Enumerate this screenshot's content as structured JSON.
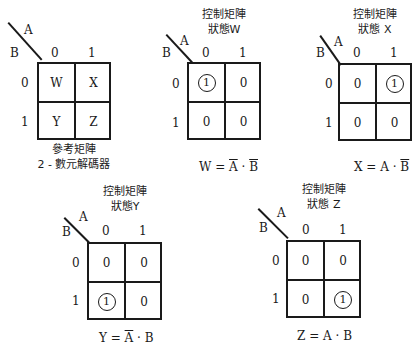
{
  "figure": {
    "axis_labels": {
      "col_var": "A",
      "row_var": "B"
    },
    "col_headers": [
      "0",
      "1"
    ],
    "row_headers": [
      "0",
      "1"
    ],
    "maps": [
      {
        "id": "reference",
        "title_line1": "",
        "title_line2": "",
        "caption_line1": "參考矩陣",
        "caption_line2": "2 - 數元解碼器",
        "cells": [
          [
            "W",
            "X"
          ],
          [
            "Y",
            "Z"
          ]
        ],
        "circled": null,
        "equation": {
          "lhs": "",
          "eq": "",
          "t1": "",
          "dot": "",
          "t2": ""
        }
      },
      {
        "id": "W",
        "title_line1": "控制矩陣",
        "title_line2": "狀態W",
        "cells": [
          [
            "1",
            "0"
          ],
          [
            "0",
            "0"
          ]
        ],
        "circled": [
          0,
          0
        ],
        "equation": {
          "lhs": "W",
          "eq": " = ",
          "t1": "A",
          "t1_bar": true,
          "dot": " · ",
          "t2": "B",
          "t2_bar": true
        }
      },
      {
        "id": "X",
        "title_line1": "控制矩陣",
        "title_line2": "狀態 X",
        "cells": [
          [
            "0",
            "1"
          ],
          [
            "0",
            "0"
          ]
        ],
        "circled": [
          0,
          1
        ],
        "equation": {
          "lhs": "X",
          "eq": " = ",
          "t1": "A",
          "t1_bar": false,
          "dot": " · ",
          "t2": "B",
          "t2_bar": true
        }
      },
      {
        "id": "Y",
        "title_line1": "控制矩陣",
        "title_line2": "狀態Y",
        "cells": [
          [
            "0",
            "0"
          ],
          [
            "1",
            "0"
          ]
        ],
        "circled": [
          1,
          0
        ],
        "equation": {
          "lhs": "Y",
          "eq": " = ",
          "t1": "A",
          "t1_bar": true,
          "dot": " · ",
          "t2": "B",
          "t2_bar": false
        }
      },
      {
        "id": "Z",
        "title_line1": "控制矩陣",
        "title_line2": "狀態 Z",
        "cells": [
          [
            "0",
            "0"
          ],
          [
            "0",
            "1"
          ]
        ],
        "circled": [
          1,
          1
        ],
        "equation": {
          "lhs": "Z",
          "eq": " = ",
          "t1": "A",
          "t1_bar": false,
          "dot": " · ",
          "t2": "B",
          "t2_bar": false
        }
      }
    ]
  }
}
